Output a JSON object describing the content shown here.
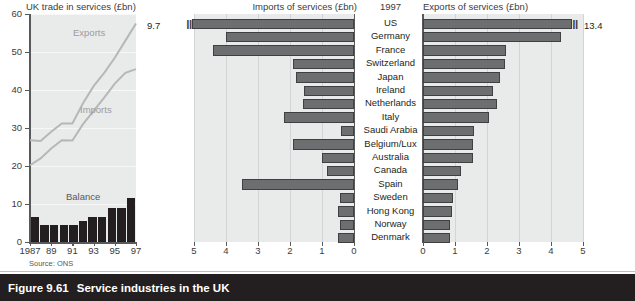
{
  "caption": {
    "figure_number": "Figure 9.61",
    "title": "Service industries in the UK"
  },
  "line_panel": {
    "title": "UK trade in services (£bn)",
    "source": "Source: ONS",
    "series_labels": {
      "exports": "Exports",
      "imports": "Imports",
      "balance": "Balance"
    },
    "y_ticks": [
      "60",
      "50",
      "40",
      "30",
      "20",
      "10",
      "0"
    ],
    "x_ticks": [
      "1987",
      "89",
      "91",
      "93",
      "95",
      "97"
    ]
  },
  "headers": {
    "imports_title": "Imports of services (£bn)",
    "year": "1997",
    "exports_title": "Exports of services (£bn)"
  },
  "axis": {
    "imports_ticks": [
      "5",
      "4",
      "3",
      "2",
      "1",
      "0"
    ],
    "exports_ticks": [
      "0",
      "1",
      "2",
      "3",
      "4",
      "5"
    ]
  },
  "outliers": {
    "imports_us_label": "9.7",
    "exports_us_label": "13.4"
  },
  "chart_data": [
    {
      "type": "line",
      "title": "UK trade in services (£bn)",
      "xlabel": "",
      "ylabel": "£bn",
      "ylim": [
        0,
        60
      ],
      "grid": true,
      "x": [
        1987,
        1988,
        1989,
        1990,
        1991,
        1992,
        1993,
        1994,
        1995,
        1996,
        1997
      ],
      "series": [
        {
          "name": "Exports",
          "values": [
            26.8,
            26.6,
            29.0,
            31.2,
            31.2,
            36.5,
            41.0,
            44.5,
            48.5,
            53.0,
            57.5
          ]
        },
        {
          "name": "Imports",
          "values": [
            20.2,
            22.0,
            24.6,
            26.8,
            26.7,
            31.0,
            34.5,
            38.0,
            41.7,
            44.5,
            45.5
          ]
        },
        {
          "name": "Balance",
          "values": [
            6.6,
            4.6,
            4.4,
            4.4,
            4.5,
            5.5,
            6.5,
            6.5,
            9.0,
            9.0,
            11.6
          ]
        }
      ],
      "balance_as_bars": true
    },
    {
      "type": "bar",
      "orientation": "horizontal-mirrored",
      "title": "Service industries in the UK — 1997",
      "xlabel": "£bn",
      "xlim": [
        0,
        5
      ],
      "grid": true,
      "categories": [
        "US",
        "Germany",
        "France",
        "Switzerland",
        "Japan",
        "Ireland",
        "Netherlands",
        "Italy",
        "Saudi Arabia",
        "Belgium/Lux",
        "Australia",
        "Canada",
        "Spain",
        "Sweden",
        "Hong Kong",
        "Norway",
        "Denmark"
      ],
      "series": [
        {
          "name": "Imports of services (£bn)",
          "direction": "left",
          "values": [
            9.7,
            4.0,
            4.4,
            1.9,
            1.8,
            1.55,
            1.6,
            2.2,
            0.4,
            1.9,
            1.0,
            0.85,
            3.5,
            0.45,
            0.5,
            0.45,
            0.5
          ],
          "note": "US bar broken at axis; actual value 9.7"
        },
        {
          "name": "Exports of services (£bn)",
          "direction": "right",
          "values": [
            13.4,
            4.3,
            2.6,
            2.55,
            2.4,
            2.2,
            2.3,
            2.05,
            1.6,
            1.55,
            1.55,
            1.2,
            1.1,
            0.95,
            0.9,
            0.85,
            0.85
          ],
          "note": "US bar broken at axis; actual value 13.4"
        }
      ]
    }
  ],
  "countries": [
    "US",
    "Germany",
    "France",
    "Switzerland",
    "Japan",
    "Ireland",
    "Netherlands",
    "Italy",
    "Saudi Arabia",
    "Belgium/Lux",
    "Australia",
    "Canada",
    "Spain",
    "Sweden",
    "Hong Kong",
    "Norway",
    "Denmark"
  ]
}
